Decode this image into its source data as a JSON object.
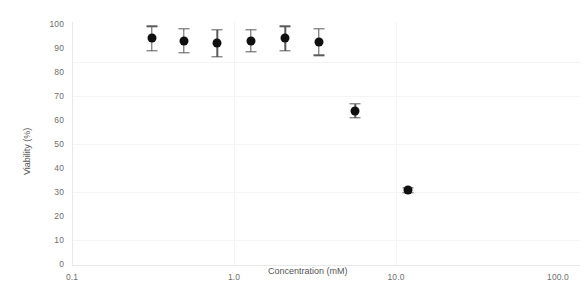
{
  "chart_data": {
    "type": "scatter",
    "title": "",
    "xlabel": "Concentration (mM)",
    "ylabel": "Viability (%)",
    "xscale": "log",
    "xlim": [
      0.1,
      100.0
    ],
    "ylim": [
      0,
      100
    ],
    "xticks": [
      "0.1",
      "1.0",
      "10.0",
      "100.0"
    ],
    "xtick_values": [
      0.1,
      1.0,
      10.0,
      100.0
    ],
    "yticks": [
      "0",
      "10",
      "20",
      "30",
      "40",
      "50",
      "60",
      "70",
      "80",
      "90",
      "100"
    ],
    "ytick_values": [
      0,
      10,
      20,
      30,
      40,
      50,
      60,
      70,
      80,
      90,
      100
    ],
    "grid": false,
    "legend": "none",
    "marker": "filled-circle",
    "marker_color": "#101010",
    "errorbar_color": "#5a5a5a",
    "series": [
      {
        "name": "Viability",
        "x": [
          0.31,
          0.49,
          0.79,
          1.27,
          2.07,
          3.35,
          5.6,
          11.8
        ],
        "y": [
          94.0,
          93.0,
          92.0,
          93.0,
          94.0,
          92.5,
          64.0,
          31.0
        ],
        "yerr": [
          5.0,
          5.0,
          5.5,
          4.5,
          5.0,
          5.5,
          3.0,
          1.0
        ]
      }
    ]
  },
  "axes": {
    "x_title": "Concentration (mM)",
    "y_title": "Viability (%)"
  }
}
